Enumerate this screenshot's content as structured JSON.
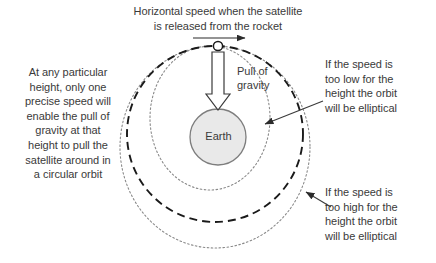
{
  "diagram": {
    "title": "Horizontal speed when the satellite\nis released from the rocket",
    "left_note": "At any particular\nheight, only one\nprecise speed will\nenable the pull of\ngravity at that\nheight to pull the\nsatellite around in\na circular orbit",
    "right_top_note": "If the speed is\ntoo low for the\nheight the orbit\nwill be elliptical",
    "right_bottom_note": "If the speed is\ntoo high for the\nheight the orbit\nwill be elliptical",
    "gravity_label": "Pull of\ngravity",
    "earth_label": "Earth"
  },
  "colors": {
    "background": "#ffffff",
    "text": "#3a3a3a",
    "circular_orbit_stroke": "#1a1a1a",
    "elliptical_orbit_stroke": "#8a8a8a",
    "earth_fill": "#e9e9e9",
    "earth_stroke": "#7d7d7d",
    "arrow_stroke": "#2b2b2b",
    "satellite_fill": "#ffffff",
    "satellite_stroke": "#1a1a1a"
  },
  "geometry": {
    "satellite": {
      "cx": 218,
      "cy": 46,
      "r": 4.5
    },
    "earth": {
      "cx": 218,
      "cy": 137,
      "r": 28
    },
    "circular_orbit": {
      "cx": 215,
      "cy": 134,
      "r": 88,
      "style": "dashed"
    },
    "elliptical_orbit_low": {
      "cx": 210,
      "cy": 118,
      "rx": 60,
      "ry": 72,
      "style": "dotted"
    },
    "elliptical_orbit_high": {
      "cx": 215,
      "cy": 147,
      "rx": 95,
      "ry": 101,
      "style": "dotted"
    },
    "speed_arrow": {
      "x1": 193,
      "y1": 38,
      "x2": 246,
      "y2": 38
    },
    "gravity_arrow": {
      "x": 218,
      "y_top": 52,
      "y_bottom": 108
    },
    "pointer_low": {
      "x1": 322,
      "y1": 101,
      "x2": 264,
      "y2": 124
    },
    "pointer_high": {
      "x1": 330,
      "y1": 206,
      "x2": 305,
      "y2": 192
    }
  }
}
